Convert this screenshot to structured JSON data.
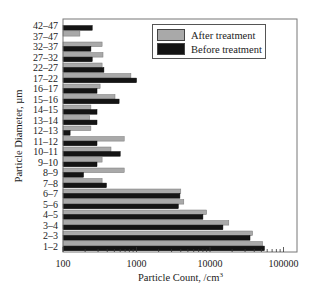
{
  "chart_data": {
    "type": "bar",
    "orientation": "horizontal",
    "title": "",
    "xlabel": "Particle Count, /cm³",
    "ylabel": "Particle Diameter, µm",
    "xscale": "log",
    "xlim": [
      100,
      100000
    ],
    "xticks": [
      "100",
      "1000",
      "10000",
      "100000"
    ],
    "grid": false,
    "legend_position": "upper right",
    "categories": [
      "42–47",
      "37–47",
      "32–37",
      "27–32",
      "22–27",
      "17–22",
      "16–17",
      "15–16",
      "14–15",
      "13–14",
      "12–13",
      "11–12",
      "10–11",
      "9–10",
      "8–9",
      "7–8",
      "6–7",
      "5–6",
      "4–5",
      "3–4",
      "2–3",
      "1–2"
    ],
    "series": [
      {
        "name": "After treatment",
        "color": "#a9a9a9",
        "values": [
          null,
          170,
          340,
          350,
          340,
          840,
          320,
          510,
          240,
          230,
          240,
          680,
          450,
          340,
          680,
          340,
          4000,
          4400,
          9000,
          18000,
          38000,
          52000
        ]
      },
      {
        "name": "Before treatment",
        "color": "#141414",
        "values": [
          250,
          null,
          240,
          250,
          360,
          1000,
          290,
          580,
          290,
          290,
          125,
          290,
          600,
          290,
          190,
          390,
          3900,
          3700,
          8000,
          15000,
          35000,
          55000
        ]
      }
    ]
  },
  "legend": {
    "after_label": "After treatment",
    "before_label": "Before treatment"
  },
  "axes": {
    "x_title": "Particle Count, /cm",
    "x_title_sup": "3",
    "y_title": "Particle Diameter, µm"
  }
}
